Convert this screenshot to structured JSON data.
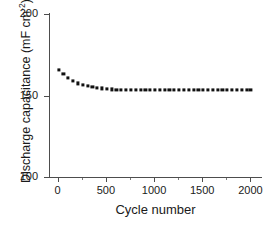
{
  "chart_data": {
    "type": "scatter",
    "title": "",
    "xlabel": "Cycle number",
    "ylabel_text": "Discharge capacitance (mF cm",
    "ylabel_sup": "-2",
    "ylabel_tail": ")",
    "ylabel_full": "Discharge capacitance (mF cm-2)",
    "xlim": [
      -90,
      2120
    ],
    "ylim": [
      100,
      200
    ],
    "grid": false,
    "legend": null,
    "marker_style": "filled-square",
    "marker_color": "#111111",
    "xticks": [
      0,
      500,
      1000,
      1500,
      2000
    ],
    "xtick_labels": [
      "0",
      "500",
      "1000",
      "1500",
      "2000"
    ],
    "xticks_minor": [
      250,
      750,
      1250,
      1750
    ],
    "yticks": [
      100,
      150,
      200
    ],
    "ytick_labels": [
      "100",
      "150",
      "200"
    ],
    "series": [
      {
        "name": "Discharge capacitance",
        "x": [
          10,
          60,
          110,
          160,
          210,
          260,
          310,
          360,
          410,
          460,
          510,
          560,
          610,
          660,
          710,
          760,
          810,
          860,
          910,
          960,
          1010,
          1060,
          1110,
          1160,
          1210,
          1260,
          1310,
          1360,
          1410,
          1460,
          1510,
          1560,
          1610,
          1660,
          1710,
          1760,
          1810,
          1860,
          1910,
          1960,
          2000
        ],
        "values": [
          165.8,
          163.0,
          160.6,
          158.8,
          157.4,
          156.3,
          156.0,
          155.4,
          154.8,
          154.3,
          153.9,
          153.7,
          153.6,
          153.6,
          153.6,
          153.5,
          153.5,
          153.5,
          153.6,
          153.6,
          153.6,
          153.6,
          153.5,
          153.5,
          153.5,
          153.6,
          153.6,
          153.6,
          153.6,
          153.6,
          153.6,
          153.6,
          153.5,
          153.5,
          153.5,
          153.5,
          153.6,
          153.6,
          153.6,
          153.6,
          153.6
        ]
      }
    ]
  },
  "axis": {
    "x_title": "Cycle number",
    "y_title_main": "Discharge capacitance (mF cm",
    "y_title_sup": "-2",
    "y_title_close": ")"
  }
}
